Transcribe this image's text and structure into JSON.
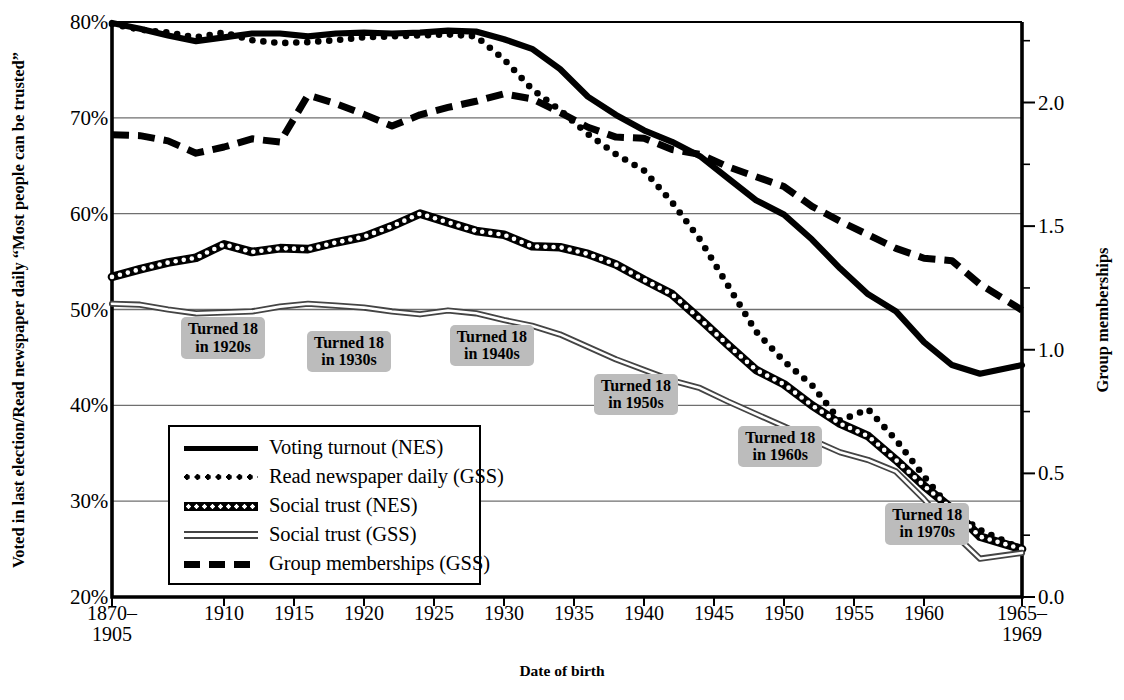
{
  "chart_data": {
    "type": "line",
    "title": "",
    "xlabel": "Date of birth",
    "ylabel_left": [
      "Voted in last election/Read newspaper daily",
      "“Most people can be trusted”"
    ],
    "ylabel_right": "Group memberships",
    "grid": "horizontal",
    "legend_position": "inside-lower-left",
    "x_tick_labels": [
      [
        "1870–",
        "1905"
      ],
      [
        "1910"
      ],
      [
        "1915"
      ],
      [
        "1920"
      ],
      [
        "1925"
      ],
      [
        "1930"
      ],
      [
        "1935"
      ],
      [
        "1940"
      ],
      [
        "1945"
      ],
      [
        "1950"
      ],
      [
        "1955"
      ],
      [
        "1960"
      ],
      [
        "1965–",
        "1969"
      ]
    ],
    "x_tick_values": [
      1902,
      1910,
      1915,
      1920,
      1925,
      1930,
      1935,
      1940,
      1945,
      1950,
      1955,
      1960,
      1967
    ],
    "ylim_left": [
      20,
      80
    ],
    "y_ticks_left": [
      "20%",
      "30%",
      "40%",
      "50%",
      "60%",
      "70%",
      "80%"
    ],
    "y_tick_values_left": [
      20,
      30,
      40,
      50,
      60,
      70,
      80
    ],
    "ylim_right": [
      0.0,
      2.3256
    ],
    "y_ticks_right": [
      "0.0",
      "0.5",
      "1.0",
      "1.5",
      "2.0"
    ],
    "y_tick_values_right": [
      0.0,
      0.5,
      1.0,
      1.5,
      2.0
    ],
    "y_minor_right": [
      0.25,
      0.75,
      1.25,
      1.75,
      2.25
    ],
    "x_values": [
      1902,
      1904,
      1906,
      1908,
      1910,
      1912,
      1914,
      1916,
      1918,
      1920,
      1922,
      1924,
      1926,
      1928,
      1930,
      1932,
      1934,
      1936,
      1938,
      1940,
      1942,
      1944,
      1946,
      1948,
      1950,
      1952,
      1954,
      1956,
      1958,
      1960,
      1962,
      1964,
      1967
    ],
    "series": [
      {
        "name": "Voting turnout (NES)",
        "axis": "left",
        "style": "solid-thick",
        "values": [
          79.9,
          79.3,
          78.6,
          78.0,
          78.4,
          78.8,
          78.8,
          78.5,
          78.8,
          78.9,
          78.8,
          78.9,
          79.1,
          79.0,
          78.2,
          77.2,
          75.1,
          72.2,
          70.3,
          68.7,
          67.5,
          66.0,
          63.7,
          61.4,
          59.9,
          57.3,
          54.3,
          51.6,
          49.8,
          46.6,
          44.2,
          43.3,
          44.2
        ]
      },
      {
        "name": "Read newspaper daily (GSS)",
        "axis": "left",
        "style": "dotted",
        "values": [
          79.8,
          79.2,
          78.9,
          78.4,
          78.9,
          78.1,
          77.8,
          77.9,
          78.1,
          78.4,
          78.5,
          78.6,
          78.7,
          78.5,
          76.1,
          73.0,
          70.8,
          68.3,
          66.2,
          64.5,
          61.2,
          57.3,
          52.5,
          47.7,
          44.6,
          42.1,
          38.4,
          39.6,
          36.4,
          32.6,
          29.0,
          27.0,
          25.0
        ]
      },
      {
        "name": "Social trust (NES)",
        "axis": "left",
        "style": "dotted-on-black",
        "values": [
          53.4,
          54.2,
          54.9,
          55.4,
          56.8,
          56.0,
          56.4,
          56.3,
          57.0,
          57.6,
          58.7,
          60.0,
          59.1,
          58.2,
          57.8,
          56.6,
          56.5,
          55.8,
          54.7,
          53.1,
          51.6,
          49.0,
          46.3,
          43.7,
          42.2,
          40.0,
          38.1,
          36.8,
          34.3,
          31.6,
          29.2,
          26.3,
          25.0
        ]
      },
      {
        "name": "Social trust (GSS)",
        "axis": "left",
        "style": "double-thin",
        "values": [
          50.6,
          50.5,
          50.0,
          49.6,
          49.7,
          49.8,
          50.3,
          50.6,
          50.4,
          50.2,
          49.8,
          49.5,
          49.9,
          49.6,
          48.9,
          48.3,
          47.4,
          46.1,
          44.8,
          43.7,
          42.6,
          41.8,
          40.4,
          39.1,
          37.8,
          36.4,
          35.1,
          34.3,
          33.1,
          30.2,
          26.8,
          24.0,
          24.6
        ]
      },
      {
        "name": "Group memberships (GSS)",
        "axis": "right",
        "style": "dashed",
        "values": [
          1.87,
          1.866,
          1.845,
          1.795,
          1.82,
          1.853,
          1.84,
          2.03,
          1.995,
          1.952,
          1.905,
          1.95,
          1.98,
          2.005,
          2.035,
          2.015,
          1.96,
          1.9,
          1.86,
          1.855,
          1.81,
          1.79,
          1.74,
          1.7,
          1.66,
          1.58,
          1.52,
          1.465,
          1.41,
          1.37,
          1.36,
          1.265,
          1.16
        ]
      }
    ],
    "annotations": [
      {
        "label": [
          "Turned 18",
          "in 1920s"
        ],
        "x": 1907.0,
        "y": 47.0
      },
      {
        "label": [
          "Turned 18",
          "in 1930s"
        ],
        "x": 1916.0,
        "y": 45.6
      },
      {
        "label": [
          "Turned 18",
          "in 1940s"
        ],
        "x": 1926.2,
        "y": 46.2
      },
      {
        "label": [
          "Turned 18",
          "in 1950s"
        ],
        "x": 1936.5,
        "y": 41.1
      },
      {
        "label": [
          "Turned 18",
          "in 1960s"
        ],
        "x": 1946.8,
        "y": 35.7
      },
      {
        "label": [
          "Turned 18",
          "in 1970s"
        ],
        "x": 1957.3,
        "y": 27.6
      }
    ]
  },
  "legend": {
    "items": [
      {
        "label": "Voting turnout (NES)",
        "style": "solid-thick"
      },
      {
        "label": "Read newspaper daily (GSS)",
        "style": "dotted"
      },
      {
        "label": "Social trust (NES)",
        "style": "dotted-on-black"
      },
      {
        "label": "Social trust (GSS)",
        "style": "double-thin"
      },
      {
        "label": "Group memberships (GSS)",
        "style": "dashed"
      }
    ]
  },
  "colors": {
    "ink": "#000000",
    "grid": "#6f6f6f",
    "callout_bg": "#bcbcbc",
    "double_line": "#444444",
    "background": "#ffffff"
  }
}
